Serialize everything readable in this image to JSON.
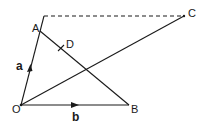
{
  "diagram": {
    "points": {
      "O": {
        "label": "O"
      },
      "A": {
        "label": "A"
      },
      "B": {
        "label": "B"
      },
      "C": {
        "label": "C"
      },
      "D": {
        "label": "D"
      }
    },
    "vectors": {
      "a": {
        "label": "a",
        "from": "O",
        "to": "A"
      },
      "b": {
        "label": "b",
        "from": "O",
        "to": "B"
      }
    },
    "segments": [
      {
        "from": "O",
        "to": "A",
        "style": "solid",
        "note": "extends beyond A"
      },
      {
        "from": "O",
        "to": "B",
        "style": "solid"
      },
      {
        "from": "A",
        "to": "B",
        "style": "solid",
        "note": "D marked on AB"
      },
      {
        "from": "O",
        "to": "C",
        "style": "solid"
      },
      {
        "from": "A-line-top",
        "to": "C",
        "style": "dashed"
      }
    ],
    "colors": {
      "line": "#1a1a1a",
      "background": "#ffffff"
    }
  }
}
